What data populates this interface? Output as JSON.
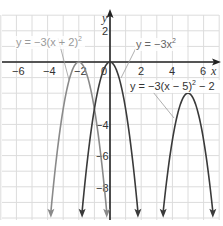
{
  "chart_data": {
    "type": "line",
    "title": "",
    "xlabel": "x",
    "ylabel": "y",
    "xlim": [
      -7,
      7
    ],
    "ylim": [
      -10,
      3
    ],
    "grid": true,
    "x_ticks": [
      -6,
      -4,
      -2,
      0,
      2,
      4,
      6
    ],
    "y_ticks": [
      2,
      -2,
      -4,
      -6,
      -8
    ],
    "x_tick_labels": [
      "-6",
      "-4",
      "-2",
      "0",
      "2",
      "4",
      "6"
    ],
    "y_tick_labels": [
      "2",
      "-2",
      "-4",
      "-6",
      "-8"
    ],
    "series": [
      {
        "name": "y = -3(x + 2)²",
        "equation": "y=-3(x+2)^2",
        "vertex": [
          -2,
          0
        ],
        "color": "#8a8a8a"
      },
      {
        "name": "y = -3x²",
        "equation": "y=-3x^2",
        "vertex": [
          0,
          0
        ],
        "color": "#3a3a3a"
      },
      {
        "name": "y = -3(x - 5)² - 2",
        "equation": "y=-3(x-5)^2-2",
        "vertex": [
          5,
          -2
        ],
        "color": "#3a3a3a"
      }
    ],
    "annotations": [
      {
        "text": "y = -3(x + 2)²",
        "points_to_series": 0
      },
      {
        "text": "y = -3x²",
        "points_to_series": 1
      },
      {
        "text": "y = -3(x - 5)² - 2",
        "points_to_series": 2
      }
    ]
  },
  "labels": {
    "x_axis": "x",
    "y_axis": "y",
    "eq1_prefix": "y = −3(x + 2)",
    "eq1_exp": "2",
    "eq2_prefix": "y = −3x",
    "eq2_exp": "2",
    "eq3_prefix": "y = −3(x − 5)",
    "eq3_exp": "2",
    "eq3_suffix": " − 2",
    "tick_x_m6": "−6",
    "tick_x_m4": "−4",
    "tick_x_m2": "−2",
    "tick_x_0": "0",
    "tick_x_2": "2",
    "tick_x_4": "4",
    "tick_x_6": "6",
    "tick_y_2": "2",
    "tick_y_m2": "−2",
    "tick_y_m4": "−4",
    "tick_y_m6": "−6",
    "tick_y_m8": "−8"
  },
  "colors": {
    "grid": "#dcdcdc",
    "axis": "#222222",
    "curve_light": "#8a8a8a",
    "curve_dark": "#3a3a3a",
    "label_light": "#9a9a9a",
    "label_dark": "#555555"
  }
}
